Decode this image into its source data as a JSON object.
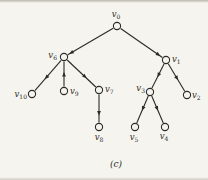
{
  "figure": {
    "caption": "(c)",
    "background": "#f6f4ef",
    "ink": "#2b2a26",
    "node_fill": "#f6f4ef",
    "node_radius": 3.6,
    "nodes": [
      {
        "id": "v0",
        "label": "v",
        "sub": "0",
        "x": 117,
        "y": 26,
        "lx": 116,
        "ly": 17,
        "anchor": "middle"
      },
      {
        "id": "v6",
        "label": "v",
        "sub": "6",
        "x": 64,
        "y": 57,
        "lx": 57,
        "ly": 58,
        "anchor": "end"
      },
      {
        "id": "v1",
        "label": "v",
        "sub": "1",
        "x": 166,
        "y": 60,
        "lx": 172,
        "ly": 62,
        "anchor": "start"
      },
      {
        "id": "v10",
        "label": "v",
        "sub": "10",
        "x": 32,
        "y": 94,
        "lx": 27,
        "ly": 97,
        "anchor": "end"
      },
      {
        "id": "v9",
        "label": "v",
        "sub": "9",
        "x": 64,
        "y": 91,
        "lx": 70,
        "ly": 94,
        "anchor": "start"
      },
      {
        "id": "v7",
        "label": "v",
        "sub": "7",
        "x": 99,
        "y": 90,
        "lx": 105,
        "ly": 92,
        "anchor": "start"
      },
      {
        "id": "v8",
        "label": "v",
        "sub": "8",
        "x": 99,
        "y": 127,
        "lx": 99,
        "ly": 140,
        "anchor": "middle"
      },
      {
        "id": "v3",
        "label": "v",
        "sub": "3",
        "x": 150,
        "y": 92,
        "lx": 145,
        "ly": 91,
        "anchor": "end"
      },
      {
        "id": "v2",
        "label": "v",
        "sub": "2",
        "x": 187,
        "y": 95,
        "lx": 192,
        "ly": 98,
        "anchor": "start"
      },
      {
        "id": "v5",
        "label": "v",
        "sub": "5",
        "x": 135,
        "y": 127,
        "lx": 134,
        "ly": 140,
        "anchor": "middle"
      },
      {
        "id": "v4",
        "label": "v",
        "sub": "4",
        "x": 165,
        "y": 127,
        "lx": 164,
        "ly": 139,
        "anchor": "middle"
      }
    ],
    "edges": [
      {
        "from": "v0",
        "to": "v6",
        "t": 0.97
      },
      {
        "from": "v0",
        "to": "v1",
        "t": 0.95
      },
      {
        "from": "v6",
        "to": "v10",
        "t": 0.62
      },
      {
        "from": "v9",
        "to": "v6",
        "t": 0.58
      },
      {
        "from": "v6",
        "to": "v7",
        "t": 0.68
      },
      {
        "from": "v7",
        "to": "v8",
        "t": 0.75
      },
      {
        "from": "v1",
        "to": "v3",
        "t": 0.55
      },
      {
        "from": "v1",
        "to": "v2",
        "t": 0.6
      },
      {
        "from": "v3",
        "to": "v5",
        "t": 0.55
      },
      {
        "from": "v3",
        "to": "v4",
        "t": 0.55
      }
    ]
  }
}
